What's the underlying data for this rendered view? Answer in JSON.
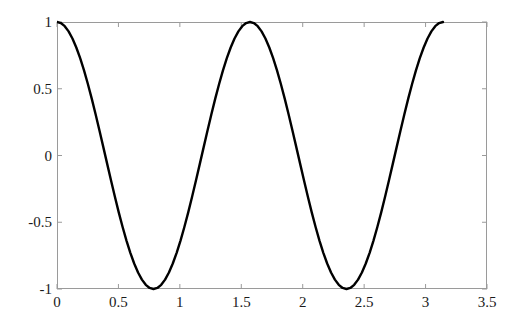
{
  "figure": {
    "background_color": "#ffffff",
    "axis_color": "#9a9a9a",
    "curve_color": "#000000",
    "label_color": "#1a1a1a",
    "plot_box": {
      "left": 57,
      "top": 22,
      "right": 487,
      "bottom": 289
    }
  },
  "chart_data": {
    "type": "line",
    "title": "",
    "subtitle": "",
    "xlabel": "",
    "ylabel": "",
    "expression": "y = cos(4x)",
    "xlim": [
      0,
      3.5
    ],
    "ylim": [
      -1,
      1
    ],
    "xticks": [
      0,
      0.5,
      1,
      1.5,
      2,
      2.5,
      3,
      3.5
    ],
    "xtick_labels": [
      "0",
      "0.5",
      "1",
      "1.5",
      "2",
      "2.5",
      "3",
      "3.5"
    ],
    "yticks": [
      -1,
      -0.5,
      0,
      0.5,
      1
    ],
    "ytick_labels": [
      "-1",
      "-0.5",
      "0",
      "0.5",
      "1"
    ],
    "grid": false,
    "legend": null,
    "legend_position": "none",
    "annotations": [],
    "series": [
      {
        "name": "cos(4x)",
        "color": "#000000",
        "line_width": 2.4,
        "x_domain": [
          0,
          3.141592653589793
        ],
        "x": [
          0.0,
          0.0314159,
          0.0628319,
          0.0942478,
          0.1256637,
          0.1570796,
          0.1884956,
          0.2199115,
          0.2513274,
          0.2827433,
          0.3141593,
          0.3455752,
          0.3769911,
          0.408407,
          0.439823,
          0.4712389,
          0.5026548,
          0.5340708,
          0.5654867,
          0.5969026,
          0.6283185,
          0.6597345,
          0.6911504,
          0.7225663,
          0.7539822,
          0.7853982,
          0.8168141,
          0.84823,
          0.8796459,
          0.9110619,
          0.9424778,
          0.9738937,
          1.0053096,
          1.0367256,
          1.0681415,
          1.0995574,
          1.1309734,
          1.1623893,
          1.1938052,
          1.2252211,
          1.2566371,
          1.288053,
          1.3194689,
          1.3508848,
          1.3823008,
          1.4137167,
          1.4451326,
          1.4765485,
          1.5079645,
          1.5393804,
          1.5707963,
          1.6022123,
          1.6336282,
          1.6650441,
          1.69646,
          1.727876,
          1.7592919,
          1.7907078,
          1.8221237,
          1.8535397,
          1.8849556,
          1.9163715,
          1.9477874,
          1.9792034,
          2.0106193,
          2.0420352,
          2.0734512,
          2.1048671,
          2.136283,
          2.1676989,
          2.1991149,
          2.2305308,
          2.2619467,
          2.2933626,
          2.3247786,
          2.3561945,
          2.3876104,
          2.4190263,
          2.4504423,
          2.4818582,
          2.5132741,
          2.54469,
          2.576106,
          2.6075219,
          2.6389378,
          2.6703538,
          2.7017697,
          2.7331856,
          2.7646015,
          2.7960175,
          2.8274334,
          2.8588493,
          2.8902652,
          2.9216812,
          2.9530971,
          2.984513,
          3.0159289,
          3.0473449,
          3.0787608,
          3.1101767,
          3.1415927
        ],
        "y": [
          1.0,
          0.99211,
          0.96858,
          0.92978,
          0.87631,
          0.80902,
          0.72897,
          0.63742,
          0.53583,
          0.42578,
          0.30902,
          0.18738,
          0.06279,
          -0.06279,
          -0.18738,
          -0.30902,
          -0.42578,
          -0.53583,
          -0.63742,
          -0.72897,
          -0.80902,
          -0.87631,
          -0.92978,
          -0.96858,
          -0.99211,
          -1.0,
          -0.99211,
          -0.96858,
          -0.92978,
          -0.87631,
          -0.80902,
          -0.72897,
          -0.63742,
          -0.53583,
          -0.42578,
          -0.30902,
          -0.18738,
          -0.06279,
          0.06279,
          0.18738,
          0.30902,
          0.42578,
          0.53583,
          0.63742,
          0.72897,
          0.80902,
          0.87631,
          0.92978,
          0.96858,
          0.99211,
          1.0,
          0.99211,
          0.96858,
          0.92978,
          0.87631,
          0.80902,
          0.72897,
          0.63742,
          0.53583,
          0.42578,
          0.30902,
          0.18738,
          0.06279,
          -0.06279,
          -0.18738,
          -0.30902,
          -0.42578,
          -0.53583,
          -0.63742,
          -0.72897,
          -0.80902,
          -0.87631,
          -0.92978,
          -0.96858,
          -0.99211,
          -1.0,
          -0.99211,
          -0.96858,
          -0.92978,
          -0.87631,
          -0.80902,
          -0.72897,
          -0.63742,
          -0.53583,
          -0.42578,
          -0.30902,
          -0.18738,
          -0.06279,
          0.06279,
          0.18738,
          0.30902,
          0.42578,
          0.53583,
          0.63742,
          0.72897,
          0.80902,
          0.87631,
          0.92978,
          0.96858,
          0.99211,
          1.0
        ]
      }
    ]
  }
}
